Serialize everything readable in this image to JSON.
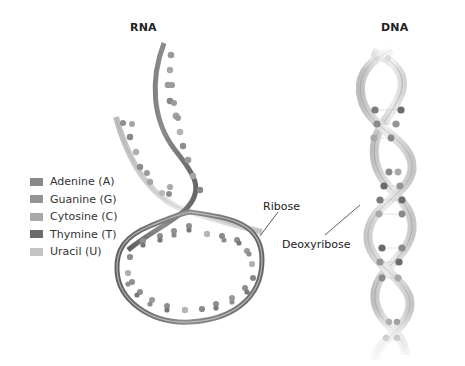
{
  "titles": {
    "rna": "RNA",
    "dna": "DNA"
  },
  "legend": {
    "items": [
      {
        "label": "Adenine (A)",
        "color": "#8a8a8a"
      },
      {
        "label": "Guanine (G)",
        "color": "#959595"
      },
      {
        "label": "Cytosine (C)",
        "color": "#a8a8a8"
      },
      {
        "label": "Thymine (T)",
        "color": "#6b6b6b"
      },
      {
        "label": "Uracil (U)",
        "color": "#c4c4c4"
      }
    ]
  },
  "annotations": {
    "ribose": "Ribose",
    "deoxyribose": "Deoxyribose"
  },
  "colors": {
    "backbone_dark": "#6e6e6e",
    "backbone_light": "#d6d6d6",
    "base_dark": "#7a7a7a",
    "base_mid": "#999999",
    "base_light": "#b8b8b8",
    "text": "#222222"
  }
}
